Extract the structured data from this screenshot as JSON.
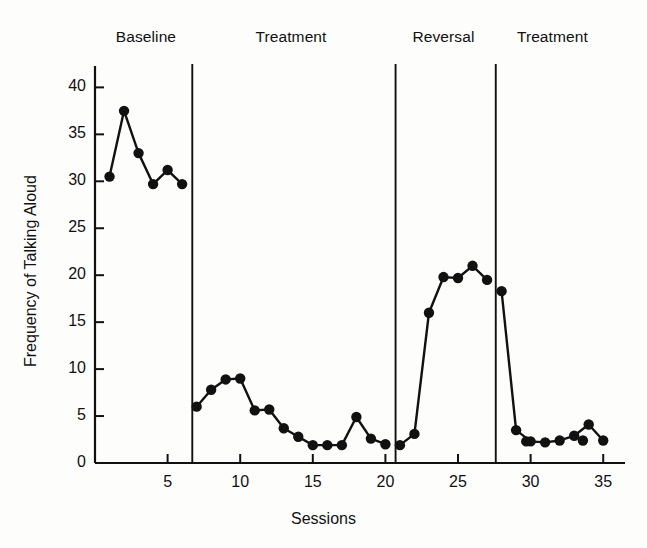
{
  "chart_data": {
    "type": "line",
    "title": "",
    "xlabel": "Sessions",
    "ylabel": "Frequency of Talking Aloud",
    "xlim": [
      0,
      36.5
    ],
    "ylim": [
      0,
      41
    ],
    "xticks": [
      5,
      10,
      15,
      20,
      25,
      30,
      35
    ],
    "yticks": [
      0,
      5,
      10,
      15,
      20,
      25,
      30,
      35,
      40
    ],
    "grid": false,
    "legend": null,
    "marker": "filled-circle",
    "line_color": "#111111",
    "marker_color": "#111111",
    "phase_labels": [
      {
        "label": "Baseline",
        "center_session": 3.5
      },
      {
        "label": "Treatment",
        "center_session": 13.5
      },
      {
        "label": "Reversal",
        "center_session": 24.0
      },
      {
        "label": "Treatment",
        "center_session": 31.5
      }
    ],
    "phase_dividers": [
      6.7,
      20.7,
      27.6
    ],
    "series": [
      {
        "name": "Baseline",
        "x": [
          1,
          2,
          3,
          4,
          5,
          6
        ],
        "values": [
          30.5,
          37.5,
          33.0,
          29.7,
          31.2,
          29.7
        ]
      },
      {
        "name": "Treatment",
        "x": [
          7,
          8,
          9,
          10,
          11,
          12,
          13,
          14,
          15,
          16,
          17,
          18,
          19,
          20
        ],
        "values": [
          6.0,
          7.8,
          8.9,
          9.0,
          5.6,
          5.7,
          3.7,
          2.8,
          1.9,
          1.9,
          1.9,
          4.9,
          2.6,
          2.0
        ]
      },
      {
        "name": "Reversal",
        "x": [
          21,
          22,
          23,
          24,
          25,
          26,
          27
        ],
        "values": [
          1.9,
          3.1,
          16.0,
          19.8,
          19.7,
          21.0,
          19.5
        ]
      },
      {
        "name": "Treatment",
        "x": [
          28,
          29,
          30,
          31,
          32,
          33,
          34,
          35
        ],
        "values": [
          18.3,
          3.5,
          2.3,
          2.2,
          2.4,
          2.9,
          4.1,
          2.4
        ]
      }
    ],
    "extra_points": [
      {
        "x": 29.7,
        "y": 2.3
      },
      {
        "x": 33.6,
        "y": 2.4
      }
    ]
  },
  "axis": {
    "y_tick_labels": [
      "0",
      "5",
      "10",
      "15",
      "20",
      "25",
      "30",
      "35",
      "40"
    ],
    "x_tick_labels": [
      "5",
      "10",
      "15",
      "20",
      "25",
      "30",
      "35"
    ],
    "x_title": "Sessions",
    "y_title": "Frequency of Talking Aloud"
  }
}
